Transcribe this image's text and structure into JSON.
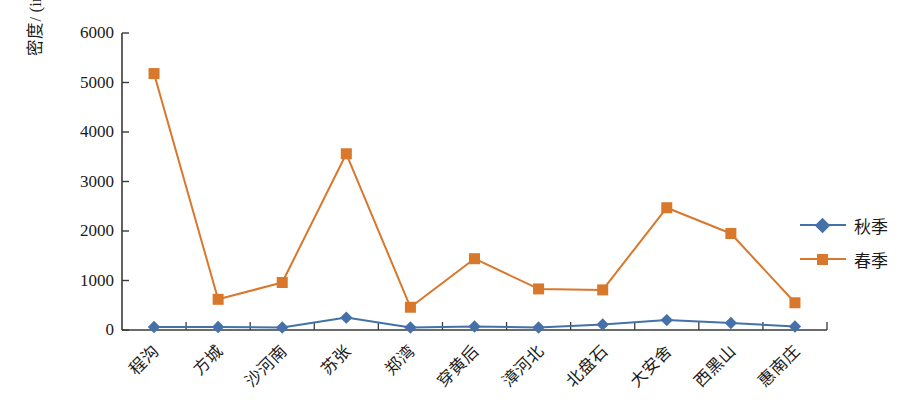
{
  "chart_data": {
    "type": "line",
    "title": "",
    "xlabel": "",
    "ylabel": "密度/ (ind/m²)",
    "ylabel_main": "密度/ (ind/m",
    "ylabel_sup": "2",
    "ylabel_tail": ")",
    "categories": [
      "程沟",
      "方城",
      "沙河南",
      "苏张",
      "郑湾",
      "穿黄后",
      "漳河北",
      "北盘石",
      "大安舍",
      "西黑山",
      "惠南庄"
    ],
    "series": [
      {
        "name": "秋季",
        "color": "#4472A8",
        "marker": "diamond",
        "values": [
          60,
          60,
          50,
          250,
          50,
          70,
          50,
          110,
          200,
          140,
          70
        ]
      },
      {
        "name": "春季",
        "color": "#D9772B",
        "marker": "square",
        "values": [
          5180,
          620,
          960,
          3560,
          460,
          1440,
          830,
          810,
          2470,
          1950,
          550
        ]
      }
    ],
    "ylim": [
      0,
      6000
    ],
    "yticks": [
      0,
      1000,
      2000,
      3000,
      4000,
      5000,
      6000
    ],
    "ytick_labels": [
      "0",
      "1000",
      "2000",
      "3000",
      "4000",
      "5000",
      "6000"
    ],
    "grid": false,
    "legend_position": "right"
  },
  "legend": {
    "entries": [
      {
        "label": "秋季",
        "color": "#4472A8",
        "marker": "diamond"
      },
      {
        "label": "春季",
        "color": "#D9772B",
        "marker": "square"
      }
    ]
  },
  "axes": {
    "axis_color": "#3a3a3a",
    "background": "#ffffff"
  }
}
